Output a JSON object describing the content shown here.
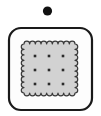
{
  "canvas": {
    "width": 101,
    "height": 116,
    "background_color": "#ffffff"
  },
  "illustration": {
    "title": "Cracker in rounded square frame",
    "description": "A small solid black dot above an outlined rounded-square frame containing a square cracker with a scalloped edge and a three by three grid of dots."
  },
  "elements": {
    "dot_marker": {
      "name": "dot-marker",
      "shape": "circle",
      "center_x": 47.5,
      "center_y": 11,
      "radius": 4.6,
      "fill_color": "#111111"
    },
    "frame": {
      "name": "rounded-square-frame",
      "shape": "rounded-rectangle",
      "x": 9,
      "y": 28,
      "width": 83,
      "height": 82,
      "corner_radius": 12,
      "fill_color": "#fdfdfd",
      "stroke_color": "#1a1a1a",
      "stroke_width": 2.2
    },
    "cracker": {
      "name": "cracker-body",
      "shape": "scalloped-square",
      "x": 24,
      "y": 44,
      "width": 51,
      "height": 49,
      "scallop_count_horizontal": 9,
      "scallop_count_vertical": 9,
      "scallop_radius": 2.9,
      "fill_color": "#d2d2d2",
      "stroke_color": "#3a3a3a",
      "stroke_width": 1.2
    },
    "cracker_holes": {
      "name": "cracker-hole-grid",
      "rows": 3,
      "columns": 3,
      "hole_shape": "square",
      "hole_size": 2.6,
      "fill_color": "#2b2b2b",
      "column_x": [
        35,
        49,
        63
      ],
      "row_y": [
        56,
        70,
        84
      ]
    }
  },
  "labels": {
    "dot": "dot",
    "frame": "frame",
    "cracker": "cracker",
    "holes": "holes"
  }
}
